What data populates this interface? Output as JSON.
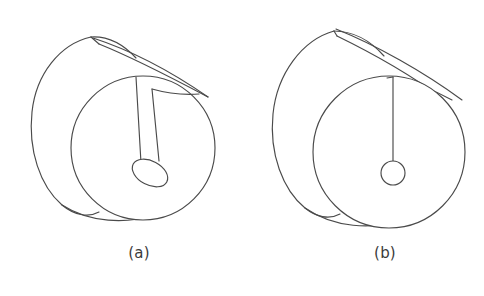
{
  "document": {
    "kind": "technical-line-drawing",
    "subject": "Cylindrical shaft shown in isometric projection with an axial keyway slot",
    "background_color": "#ffffff",
    "line_color": "#4a4a4a",
    "text_color": "#3b3b3b",
    "figure_count": 2
  },
  "figures": [
    {
      "id": "a",
      "caption": "(a)",
      "title": "Cylinder with narrow keyway slot ending in an elongated oval pocket",
      "front_face": {
        "shape": "circle",
        "center": [
          143,
          148
        ],
        "radius": 72
      },
      "back_face": {
        "shape": "ellipse",
        "center": [
          75,
          118
        ],
        "rx": 42,
        "ry": 72,
        "rotation_deg": -18
      },
      "slot": {
        "type": "narrow-parallel-slot",
        "line_count": 2,
        "start": [
          139,
          78
        ],
        "end": [
          153,
          160
        ],
        "width_px": 14,
        "terminator": {
          "shape": "oval",
          "center": [
            150,
            172
          ],
          "rx": 19,
          "ry": 12,
          "rotation_deg": 28
        }
      },
      "top_groove": {
        "type": "tapering-band",
        "apex": [
          91,
          37
        ],
        "far_point": [
          208,
          97
        ]
      }
    },
    {
      "id": "b",
      "caption": "(b)",
      "title": "Cylinder with single-line slit ending in a small circular hole",
      "front_face": {
        "shape": "circle",
        "center": [
          147,
          152
        ],
        "radius": 76
      },
      "back_face": {
        "shape": "ellipse",
        "center": [
          72,
          118
        ],
        "rx": 42,
        "ry": 74,
        "rotation_deg": -18
      },
      "slot": {
        "type": "single-line-slit",
        "line_count": 1,
        "start": [
          151,
          79
        ],
        "end": [
          151,
          162
        ],
        "width_px": 0,
        "terminator": {
          "shape": "circle",
          "center": [
            151,
            172
          ],
          "radius": 12
        }
      },
      "top_groove": {
        "type": "open-v-band",
        "apex": [
          92,
          28
        ],
        "far_point": [
          220,
          100
        ]
      }
    }
  ]
}
